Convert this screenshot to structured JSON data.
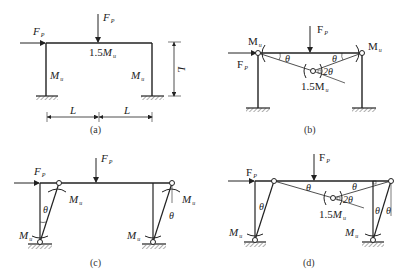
{
  "panels": {
    "a": {
      "caption": "(a)",
      "force_h": {
        "sym": "F",
        "sub": "P"
      },
      "force_v": {
        "sym": "F",
        "sub": "P"
      },
      "beam_moment": {
        "coef": "1.5",
        "sym": "M",
        "sub": "u"
      },
      "left_col_moment": {
        "sym": "M",
        "sub": "u"
      },
      "right_col_moment": {
        "sym": "M",
        "sub": "u"
      },
      "dim_height": "L",
      "dim_left": "L",
      "dim_right": "L"
    },
    "b": {
      "caption": "(b)",
      "force_h": {
        "sym": "F",
        "sub": "P"
      },
      "force_v": {
        "sym": "F",
        "sub": "P"
      },
      "left_hinge_moment": {
        "sym": "M",
        "sub": "u"
      },
      "right_hinge_moment": {
        "sym": "M",
        "sub": "u"
      },
      "mid_hinge_moment": {
        "coef": "1.5",
        "sym": "M",
        "sub": "u"
      },
      "angle_left": "θ",
      "angle_right": "θ",
      "angle_mid": "2θ"
    },
    "c": {
      "caption": "(c)",
      "force_h": {
        "sym": "F",
        "sub": "P"
      },
      "force_v": {
        "sym": "F",
        "sub": "P"
      },
      "left_top_moment": {
        "sym": "M",
        "sub": "u"
      },
      "right_top_moment": {
        "sym": "M",
        "sub": "u"
      },
      "left_base_moment": {
        "sym": "M",
        "sub": "u"
      },
      "right_base_moment": {
        "sym": "M",
        "sub": "u"
      },
      "angle_left": "θ",
      "angle_right": "θ"
    },
    "d": {
      "caption": "(d)",
      "force_h": {
        "sym": "F",
        "sub": "P"
      },
      "force_v": {
        "sym": "F",
        "sub": "P"
      },
      "mid_hinge_moment": {
        "coef": "1.5",
        "sym": "M",
        "sub": "u"
      },
      "left_base_moment": {
        "sym": "M",
        "sub": "u"
      },
      "right_base_moment": {
        "sym": "M",
        "sub": "u"
      },
      "angle_beam_left": "θ",
      "angle_beam_right": "θ",
      "angle_mid": "2θ",
      "angle_left_col": "θ",
      "angle_right_col_1": "θ",
      "angle_right_col_2": "θ"
    }
  }
}
